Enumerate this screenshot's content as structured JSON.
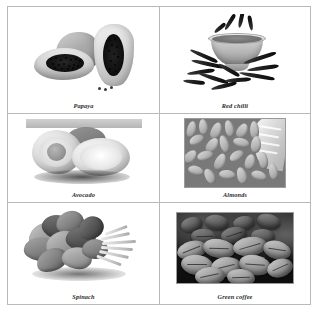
{
  "figure": {
    "name": "food-photo-grid",
    "layout": {
      "columns": 2,
      "rows": 3
    },
    "border_color": "#b9b9b9",
    "background_color": "#ffffff",
    "caption_color": "#2b2b2b",
    "rendering": "grayscale"
  },
  "cells": [
    {
      "id": "papaya",
      "caption": "Papaya",
      "row": 1,
      "column": 1,
      "subject": "papaya-fruit-whole-and-halved"
    },
    {
      "id": "red-chilli",
      "caption": "Red chilli",
      "row": 1,
      "column": 2,
      "subject": "bowl-of-chilli-powder-with-dried-chillies"
    },
    {
      "id": "avocado",
      "caption": "Avocado",
      "row": 2,
      "column": 1,
      "subject": "avocado-halves-with-pit"
    },
    {
      "id": "almonds",
      "caption": "Almonds",
      "row": 2,
      "column": 2,
      "subject": "pile-of-almonds-with-cloth"
    },
    {
      "id": "spinach",
      "caption": "Spinach",
      "row": 3,
      "column": 1,
      "subject": "bunch-of-spinach-leaves"
    },
    {
      "id": "green-coffee",
      "caption": "Green coffee",
      "row": 3,
      "column": 2,
      "subject": "green-coffee-beans"
    }
  ]
}
